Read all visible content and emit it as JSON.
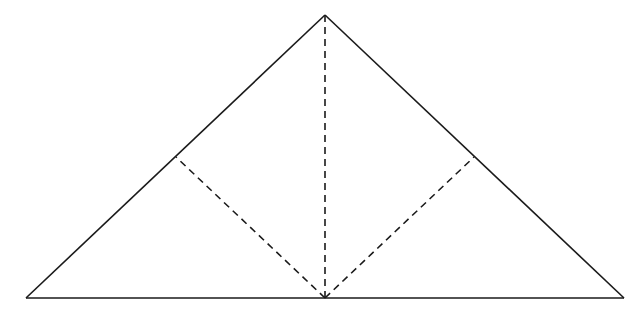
{
  "diagram": {
    "type": "geometry-figure",
    "colors": {
      "stroke": "#1a1a1a",
      "background": "#ffffff"
    },
    "points": {
      "A_left": [
        26,
        298
      ],
      "B_right": [
        624,
        298
      ],
      "C_apex": [
        325,
        15
      ],
      "M_base_mid": [
        325,
        298
      ],
      "P_left_foot": [
        176,
        157
      ],
      "Q_right_foot": [
        474,
        157
      ]
    },
    "solid_segments": [
      {
        "name": "left-side",
        "from": "A_left",
        "to": "C_apex"
      },
      {
        "name": "right-side",
        "from": "C_apex",
        "to": "B_right"
      },
      {
        "name": "base",
        "from": "A_left",
        "to": "B_right"
      }
    ],
    "dashed_segments": [
      {
        "name": "altitude",
        "from": "C_apex",
        "to": "M_base_mid"
      },
      {
        "name": "left-perpendicular",
        "from": "M_base_mid",
        "to": "P_left_foot"
      },
      {
        "name": "right-perpendicular",
        "from": "M_base_mid",
        "to": "Q_right_foot"
      }
    ],
    "labels": []
  }
}
